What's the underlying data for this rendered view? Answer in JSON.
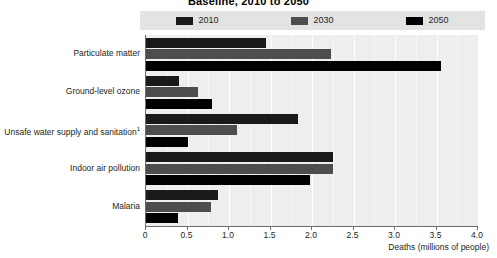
{
  "chart_data": {
    "type": "bar",
    "orientation": "horizontal",
    "title": "Baseline, 2010 to 2050",
    "xlabel": "Deaths (millions of people)",
    "ylabel": "",
    "xlim": [
      0,
      4.0
    ],
    "xticks": [
      "0",
      "0.5",
      "1.0",
      "1.5",
      "2.0",
      "2.5",
      "3.0",
      "3.5",
      "4.0"
    ],
    "xtick_values": [
      0,
      0.5,
      1.0,
      1.5,
      2.0,
      2.5,
      3.0,
      3.5,
      4.0
    ],
    "grid": true,
    "legend_position": "top",
    "categories": [
      "Particulate matter",
      "Ground-level ozone",
      "Unsafe water supply and sanitation",
      "Indoor air pollution",
      "Malaria"
    ],
    "category_footnotes": [
      "",
      "",
      "1",
      "",
      ""
    ],
    "series": [
      {
        "name": "2010",
        "color": "#1a1a1a",
        "values": [
          1.45,
          0.4,
          1.83,
          2.25,
          0.87
        ]
      },
      {
        "name": "2030",
        "color": "#4d4d4d",
        "values": [
          2.23,
          0.63,
          1.1,
          2.25,
          0.78
        ]
      },
      {
        "name": "2050",
        "color": "#000000",
        "values": [
          3.55,
          0.8,
          0.5,
          1.98,
          0.38
        ]
      }
    ]
  },
  "legend": {
    "items": [
      {
        "label": "2010",
        "color": "#1a1a1a"
      },
      {
        "label": "2030",
        "color": "#4d4d4d"
      },
      {
        "label": "2050",
        "color": "#000000"
      }
    ]
  },
  "axis": {
    "x_title": "Deaths (millions of people)"
  },
  "colors": {
    "plot_background": "#eeeeee",
    "legend_background": "#e3e3e3",
    "gridline": "#ffffff",
    "axis": "#6d6d6d",
    "text": "#231f20"
  }
}
